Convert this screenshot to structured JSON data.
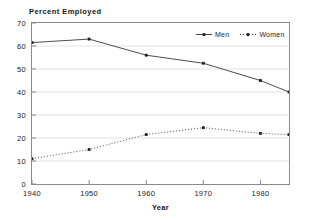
{
  "chart_data": {
    "type": "line",
    "title": "Percent Employed",
    "xlabel": "Year",
    "ylabel": "",
    "x": [
      1940,
      1950,
      1960,
      1970,
      1980,
      1985
    ],
    "xlim": [
      1940,
      1985
    ],
    "ylim": [
      0,
      70
    ],
    "xticks": [
      1940,
      1950,
      1960,
      1970,
      1980
    ],
    "yticks": [
      0,
      10,
      20,
      30,
      40,
      50,
      60,
      70
    ],
    "grid": "horizontal",
    "legend_position": "top-right",
    "series": [
      {
        "name": "Men",
        "linestyle": "solid",
        "marker": "square",
        "color": "#4d4d4d",
        "values": [
          61.5,
          63.0,
          56.0,
          52.5,
          45.0,
          40.0
        ]
      },
      {
        "name": "Women",
        "linestyle": "dotted",
        "marker": "square",
        "color": "#4d4d4d",
        "values": [
          11.0,
          15.0,
          21.5,
          24.5,
          22.0,
          21.5
        ]
      }
    ]
  },
  "axis": {
    "y_tick_labels": [
      "70",
      "60",
      "50",
      "40",
      "30",
      "20",
      "10",
      "0"
    ],
    "x_tick_labels": [
      "1940",
      "1950",
      "1960",
      "1970",
      "1980"
    ]
  },
  "legend": {
    "entries": [
      {
        "label": "Men"
      },
      {
        "label": "Women"
      }
    ]
  }
}
